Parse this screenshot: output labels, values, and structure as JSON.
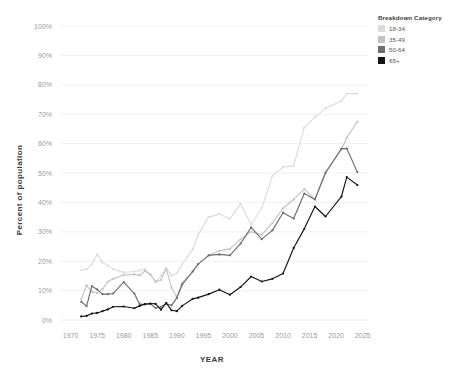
{
  "chart_data": {
    "type": "line",
    "title": "",
    "xlabel": "YEAR",
    "ylabel": "Percent of population",
    "xlim": [
      1968,
      2026
    ],
    "ylim": [
      0,
      100
    ],
    "grid": true,
    "legend_position": "right",
    "legend_title": "Breakdown Category",
    "x_tick_labels": [
      "1970",
      "1975",
      "1980",
      "1985",
      "1990",
      "1995",
      "2000",
      "2005",
      "2010",
      "2015",
      "2020",
      "2025"
    ],
    "x_ticks": [
      1970,
      1975,
      1980,
      1985,
      1990,
      1995,
      2000,
      2005,
      2010,
      2015,
      2020,
      2025
    ],
    "y_tick_labels": [
      "0%",
      "10%",
      "20%",
      "30%",
      "40%",
      "50%",
      "60%",
      "70%",
      "80%",
      "90%",
      "100%"
    ],
    "y_ticks": [
      0,
      10,
      20,
      30,
      40,
      50,
      60,
      70,
      80,
      90,
      100
    ],
    "x": [
      1972,
      1973,
      1974,
      1975,
      1976,
      1977,
      1978,
      1980,
      1982,
      1983,
      1984,
      1985,
      1986,
      1987,
      1988,
      1989,
      1990,
      1991,
      1993,
      1994,
      1996,
      1998,
      2000,
      2002,
      2004,
      2006,
      2008,
      2010,
      2012,
      2014,
      2016,
      2018,
      2021,
      2022,
      2024
    ],
    "series": [
      {
        "name": "18-34",
        "color": "#dcdcdc",
        "values": [
          17.0,
          17.2,
          19.0,
          22.3,
          19.6,
          18.5,
          17.3,
          16.2,
          16.5,
          16.8,
          17.3,
          15.3,
          13.0,
          15.0,
          17.5,
          15.0,
          16.0,
          19.0,
          24.0,
          29.0,
          35.0,
          36.0,
          34.5,
          39.5,
          32.5,
          38.0,
          49.0,
          52.0,
          52.5,
          65.5,
          69.0,
          72.0,
          74.5,
          77.0,
          77.0
        ]
      },
      {
        "name": "35-49",
        "color": "#c3c3c3",
        "values": [
          7.0,
          11.8,
          9.6,
          9.2,
          10.5,
          13.0,
          14.0,
          15.3,
          15.5,
          15.2,
          16.7,
          15.6,
          13.0,
          13.6,
          17.5,
          11.0,
          7.8,
          12.6,
          16.6,
          19.0,
          22.0,
          23.5,
          24.2,
          27.5,
          30.0,
          29.0,
          33.0,
          38.0,
          41.0,
          44.5,
          41.0,
          50.5,
          58.0,
          62.0,
          67.5
        ]
      },
      {
        "name": "50-64",
        "color": "#6e6e6e",
        "values": [
          6.2,
          4.7,
          11.5,
          10.4,
          8.8,
          8.8,
          9.0,
          12.9,
          9.0,
          5.4,
          5.3,
          5.5,
          4.1,
          4.5,
          5.5,
          5.0,
          7.5,
          12.0,
          16.5,
          19.0,
          22.0,
          22.3,
          22.0,
          26.0,
          31.5,
          27.5,
          30.5,
          36.5,
          34.5,
          43.0,
          41.0,
          50.0,
          58.3,
          58.3,
          50.3
        ]
      },
      {
        "name": "65+",
        "color": "#141414",
        "values": [
          1.2,
          1.4,
          2.2,
          2.4,
          3.0,
          3.6,
          4.5,
          4.6,
          4.0,
          4.8,
          5.4,
          5.6,
          5.5,
          3.5,
          5.8,
          3.3,
          3.0,
          4.8,
          7.2,
          7.6,
          8.8,
          10.3,
          8.6,
          11.2,
          14.8,
          13.1,
          14.0,
          15.8,
          24.5,
          31.0,
          38.6,
          35.2,
          42.0,
          48.6,
          45.9
        ]
      }
    ]
  },
  "legend": {
    "title": "Breakdown Category",
    "items": [
      {
        "label": "18-34",
        "color": "#dcdcdc"
      },
      {
        "label": "35-49",
        "color": "#c3c3c3"
      },
      {
        "label": "50-64",
        "color": "#6e6e6e"
      },
      {
        "label": "65+",
        "color": "#141414"
      }
    ]
  }
}
